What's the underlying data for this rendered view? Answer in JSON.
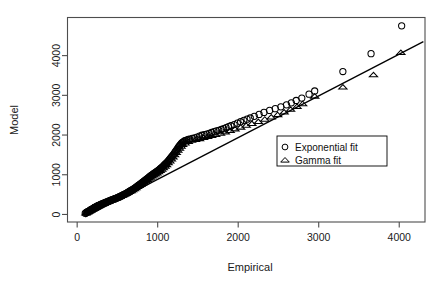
{
  "chart_data": {
    "type": "scatter",
    "title": "",
    "xlabel": "Empirical",
    "ylabel": "Model",
    "xlim": [
      -120,
      4320
    ],
    "ylim": [
      -190,
      4960
    ],
    "xticks": [
      0,
      1000,
      2000,
      3000,
      4000
    ],
    "yticks": [
      0,
      1000,
      2000,
      3000,
      4000
    ],
    "xtick_labels": [
      "0",
      "1000",
      "2000",
      "3000",
      "4000"
    ],
    "ytick_labels": [
      "0",
      "1000",
      "2000",
      "3000",
      "4000"
    ],
    "grid": false,
    "box": true,
    "legend": {
      "position": "right-center",
      "entries": [
        {
          "label": "Exponential fit",
          "marker": "circle"
        },
        {
          "label": "Gamma fit",
          "marker": "triangle"
        }
      ]
    },
    "reference_line": {
      "style": "solid",
      "color": "#000000",
      "x": [
        100,
        4300
      ],
      "y": [
        -60,
        4350
      ]
    },
    "series": [
      {
        "name": "Exponential fit",
        "marker": "circle",
        "color": "#000000",
        "points": [
          [
            100,
            30
          ],
          [
            110,
            45
          ],
          [
            120,
            60
          ],
          [
            130,
            70
          ],
          [
            140,
            80
          ],
          [
            150,
            90
          ],
          [
            160,
            100
          ],
          [
            165,
            110
          ],
          [
            170,
            120
          ],
          [
            180,
            130
          ],
          [
            190,
            140
          ],
          [
            200,
            150
          ],
          [
            205,
            160
          ],
          [
            210,
            165
          ],
          [
            215,
            172
          ],
          [
            220,
            180
          ],
          [
            230,
            190
          ],
          [
            240,
            200
          ],
          [
            250,
            210
          ],
          [
            255,
            215
          ],
          [
            260,
            222
          ],
          [
            270,
            230
          ],
          [
            280,
            240
          ],
          [
            290,
            250
          ],
          [
            300,
            258
          ],
          [
            310,
            266
          ],
          [
            320,
            275
          ],
          [
            330,
            284
          ],
          [
            340,
            292
          ],
          [
            350,
            300
          ],
          [
            360,
            308
          ],
          [
            370,
            316
          ],
          [
            380,
            325
          ],
          [
            390,
            334
          ],
          [
            400,
            342
          ],
          [
            410,
            350
          ],
          [
            420,
            358
          ],
          [
            430,
            366
          ],
          [
            440,
            374
          ],
          [
            450,
            382
          ],
          [
            460,
            390
          ],
          [
            470,
            398
          ],
          [
            480,
            406
          ],
          [
            490,
            414
          ],
          [
            500,
            422
          ],
          [
            510,
            430
          ],
          [
            520,
            440
          ],
          [
            530,
            450
          ],
          [
            540,
            460
          ],
          [
            550,
            470
          ],
          [
            560,
            480
          ],
          [
            570,
            490
          ],
          [
            580,
            500
          ],
          [
            590,
            510
          ],
          [
            600,
            520
          ],
          [
            610,
            532
          ],
          [
            620,
            544
          ],
          [
            630,
            556
          ],
          [
            640,
            568
          ],
          [
            650,
            580
          ],
          [
            660,
            592
          ],
          [
            670,
            604
          ],
          [
            680,
            616
          ],
          [
            690,
            628
          ],
          [
            700,
            640
          ],
          [
            710,
            655
          ],
          [
            720,
            670
          ],
          [
            730,
            685
          ],
          [
            740,
            700
          ],
          [
            750,
            715
          ],
          [
            760,
            730
          ],
          [
            770,
            745
          ],
          [
            780,
            760
          ],
          [
            790,
            775
          ],
          [
            800,
            790
          ],
          [
            810,
            806
          ],
          [
            820,
            822
          ],
          [
            830,
            838
          ],
          [
            840,
            854
          ],
          [
            850,
            870
          ],
          [
            860,
            886
          ],
          [
            870,
            902
          ],
          [
            880,
            918
          ],
          [
            890,
            934
          ],
          [
            900,
            950
          ],
          [
            910,
            966
          ],
          [
            920,
            982
          ],
          [
            930,
            998
          ],
          [
            940,
            1012
          ],
          [
            950,
            1026
          ],
          [
            960,
            1040
          ],
          [
            970,
            1054
          ],
          [
            980,
            1068
          ],
          [
            990,
            1082
          ],
          [
            1000,
            1096
          ],
          [
            1010,
            1110
          ],
          [
            1020,
            1128
          ],
          [
            1030,
            1146
          ],
          [
            1040,
            1164
          ],
          [
            1050,
            1182
          ],
          [
            1060,
            1200
          ],
          [
            1070,
            1220
          ],
          [
            1080,
            1240
          ],
          [
            1090,
            1260
          ],
          [
            1100,
            1280
          ],
          [
            1110,
            1300
          ],
          [
            1120,
            1320
          ],
          [
            1130,
            1345
          ],
          [
            1140,
            1370
          ],
          [
            1150,
            1395
          ],
          [
            1160,
            1420
          ],
          [
            1170,
            1445
          ],
          [
            1180,
            1470
          ],
          [
            1190,
            1495
          ],
          [
            1200,
            1520
          ],
          [
            1210,
            1550
          ],
          [
            1220,
            1580
          ],
          [
            1230,
            1610
          ],
          [
            1240,
            1640
          ],
          [
            1250,
            1670
          ],
          [
            1260,
            1700
          ],
          [
            1270,
            1725
          ],
          [
            1280,
            1750
          ],
          [
            1290,
            1775
          ],
          [
            1300,
            1800
          ],
          [
            1310,
            1815
          ],
          [
            1320,
            1830
          ],
          [
            1330,
            1845
          ],
          [
            1340,
            1860
          ],
          [
            1360,
            1875
          ],
          [
            1380,
            1890
          ],
          [
            1400,
            1900
          ],
          [
            1430,
            1915
          ],
          [
            1460,
            1930
          ],
          [
            1490,
            1950
          ],
          [
            1520,
            1975
          ],
          [
            1550,
            1995
          ],
          [
            1580,
            2010
          ],
          [
            1610,
            2025
          ],
          [
            1640,
            2045
          ],
          [
            1670,
            2065
          ],
          [
            1700,
            2085
          ],
          [
            1730,
            2105
          ],
          [
            1760,
            2120
          ],
          [
            1790,
            2140
          ],
          [
            1820,
            2160
          ],
          [
            1850,
            2185
          ],
          [
            1880,
            2210
          ],
          [
            1910,
            2235
          ],
          [
            1950,
            2265
          ],
          [
            1990,
            2300
          ],
          [
            2030,
            2335
          ],
          [
            2070,
            2370
          ],
          [
            2110,
            2400
          ],
          [
            2150,
            2430
          ],
          [
            2200,
            2470
          ],
          [
            2260,
            2520
          ],
          [
            2320,
            2570
          ],
          [
            2390,
            2620
          ],
          [
            2460,
            2665
          ],
          [
            2530,
            2710
          ],
          [
            2600,
            2760
          ],
          [
            2660,
            2810
          ],
          [
            2720,
            2870
          ],
          [
            2790,
            2930
          ],
          [
            2880,
            3030
          ],
          [
            2950,
            3110
          ],
          [
            3300,
            3600
          ],
          [
            3650,
            4050
          ],
          [
            4030,
            4750
          ]
        ]
      },
      {
        "name": "Gamma fit",
        "marker": "triangle",
        "color": "#000000",
        "points": [
          [
            110,
            40
          ],
          [
            130,
            65
          ],
          [
            150,
            88
          ],
          [
            170,
            112
          ],
          [
            190,
            136
          ],
          [
            210,
            158
          ],
          [
            230,
            185
          ],
          [
            250,
            208
          ],
          [
            270,
            228
          ],
          [
            290,
            250
          ],
          [
            310,
            268
          ],
          [
            330,
            288
          ],
          [
            350,
            305
          ],
          [
            370,
            322
          ],
          [
            390,
            340
          ],
          [
            410,
            356
          ],
          [
            430,
            372
          ],
          [
            450,
            390
          ],
          [
            470,
            406
          ],
          [
            490,
            422
          ],
          [
            510,
            440
          ],
          [
            530,
            458
          ],
          [
            550,
            476
          ],
          [
            570,
            495
          ],
          [
            590,
            514
          ],
          [
            610,
            534
          ],
          [
            630,
            556
          ],
          [
            650,
            578
          ],
          [
            670,
            600
          ],
          [
            690,
            624
          ],
          [
            710,
            650
          ],
          [
            730,
            676
          ],
          [
            750,
            702
          ],
          [
            770,
            730
          ],
          [
            790,
            758
          ],
          [
            810,
            790
          ],
          [
            830,
            820
          ],
          [
            850,
            850
          ],
          [
            870,
            880
          ],
          [
            890,
            910
          ],
          [
            910,
            940
          ],
          [
            930,
            970
          ],
          [
            950,
            995
          ],
          [
            970,
            1020
          ],
          [
            990,
            1048
          ],
          [
            1010,
            1076
          ],
          [
            1030,
            1106
          ],
          [
            1050,
            1140
          ],
          [
            1070,
            1175
          ],
          [
            1090,
            1215
          ],
          [
            1110,
            1255
          ],
          [
            1130,
            1300
          ],
          [
            1150,
            1348
          ],
          [
            1170,
            1398
          ],
          [
            1190,
            1450
          ],
          [
            1210,
            1505
          ],
          [
            1230,
            1560
          ],
          [
            1250,
            1615
          ],
          [
            1270,
            1670
          ],
          [
            1290,
            1720
          ],
          [
            1310,
            1760
          ],
          [
            1340,
            1800
          ],
          [
            1380,
            1840
          ],
          [
            1420,
            1870
          ],
          [
            1470,
            1890
          ],
          [
            1520,
            1910
          ],
          [
            1570,
            1940
          ],
          [
            1620,
            1965
          ],
          [
            1670,
            1990
          ],
          [
            1720,
            2015
          ],
          [
            1780,
            2045
          ],
          [
            1840,
            2080
          ],
          [
            1900,
            2115
          ],
          [
            1960,
            2155
          ],
          [
            2030,
            2200
          ],
          [
            2100,
            2245
          ],
          [
            2170,
            2290
          ],
          [
            2250,
            2340
          ],
          [
            2330,
            2400
          ],
          [
            2410,
            2455
          ],
          [
            2490,
            2515
          ],
          [
            2570,
            2580
          ],
          [
            2650,
            2650
          ],
          [
            2730,
            2720
          ],
          [
            2800,
            2790
          ],
          [
            2950,
            2980
          ],
          [
            3300,
            3210
          ],
          [
            3680,
            3520
          ],
          [
            4020,
            4080
          ]
        ]
      }
    ]
  }
}
